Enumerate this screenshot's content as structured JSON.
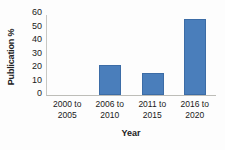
{
  "chart_data": {
    "type": "bar",
    "title": "",
    "subtitle": "",
    "xlabel": "Year",
    "ylabel": "Publication %",
    "categories": [
      "2000 to 2005",
      "2006 to 2010",
      "2011 to 2015",
      "2016 to 2020"
    ],
    "category_lines": [
      [
        "2000 to",
        "2005"
      ],
      [
        "2006 to",
        "2010"
      ],
      [
        "2011 to",
        "2015"
      ],
      [
        "2016 to",
        "2020"
      ]
    ],
    "values": [
      0,
      22,
      16,
      56.5
    ],
    "ylim": [
      0,
      60
    ],
    "ytick_step": 10,
    "yticks": [
      0,
      10,
      20,
      30,
      40,
      50,
      60
    ],
    "ytick_labels": [
      "0",
      "10",
      "20",
      "30",
      "40",
      "50",
      "60"
    ],
    "grid": false,
    "legend": false,
    "legend_position": "none",
    "bar_color": "#4a7ebb",
    "bar_border_color": "#3c6ca6",
    "axis_color": "#c8c8c4",
    "text_color": "#1a1a1a",
    "background_color": "#fdfdfd",
    "annotations": []
  }
}
